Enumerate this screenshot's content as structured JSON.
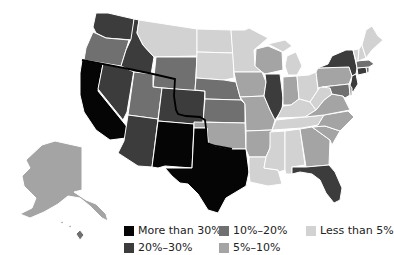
{
  "map": {
    "title": "",
    "region": "United States",
    "highlight_line": "black border line along 37°N / Oklahoma–Texas boundary",
    "colors": {
      "more_than_30": "#050505",
      "20_30": "#3c3c3c",
      "10_20": "#707070",
      "5_10": "#a4a4a4",
      "less_than_5": "#d2d2d2"
    },
    "states": {
      "WA": "20_30",
      "OR": "10_20",
      "CA": "more_than_30",
      "NV": "20_30",
      "ID": "20_30",
      "MT": "less_than_5",
      "WY": "10_20",
      "UT": "10_20",
      "AZ": "20_30",
      "NM": "more_than_30",
      "CO": "20_30",
      "ND": "less_than_5",
      "SD": "less_than_5",
      "NE": "10_20",
      "KS": "10_20",
      "OK": "5_10",
      "TX": "more_than_30",
      "MN": "less_than_5",
      "IA": "5_10",
      "MO": "5_10",
      "AR": "5_10",
      "LA": "less_than_5",
      "WI": "5_10",
      "IL": "20_30",
      "MS": "less_than_5",
      "MI": "less_than_5",
      "IN": "5_10",
      "KY": "less_than_5",
      "TN": "less_than_5",
      "AL": "less_than_5",
      "OH": "less_than_5",
      "WV": "less_than_5",
      "VA": "5_10",
      "NC": "5_10",
      "SC": "5_10",
      "GA": "5_10",
      "FL": "20_30",
      "PA": "5_10",
      "NY": "20_30",
      "NJ": "20_30",
      "MD": "10_20",
      "DE": "5_10",
      "CT": "20_30",
      "RI": "10_20",
      "MA": "10_20",
      "VT": "less_than_5",
      "NH": "less_than_5",
      "ME": "less_than_5",
      "AK": "5_10",
      "HI": "10_20"
    }
  },
  "legend": {
    "items": [
      {
        "key": "more_than_30",
        "label": "More than 30%",
        "color": "#050505"
      },
      {
        "key": "10_20",
        "label": "10%–20%",
        "color": "#707070"
      },
      {
        "key": "less_than_5",
        "label": "Less than 5%",
        "color": "#d2d2d2"
      },
      {
        "key": "20_30",
        "label": "20%–30%",
        "color": "#3c3c3c"
      },
      {
        "key": "5_10",
        "label": "5%–10%",
        "color": "#a4a4a4"
      }
    ]
  }
}
